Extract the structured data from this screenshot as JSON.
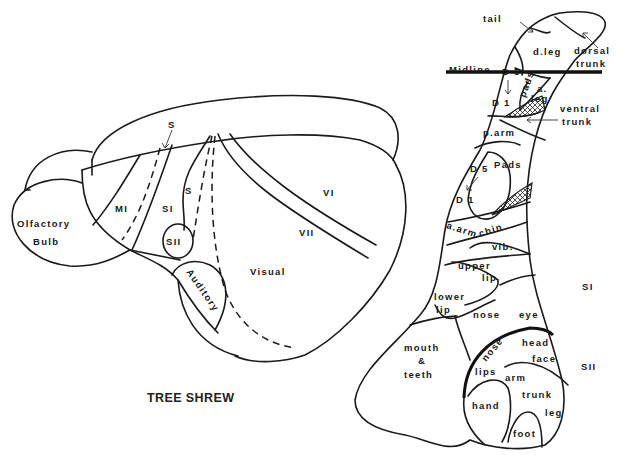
{
  "title": "TREE SHREW",
  "brain": {
    "regions": {
      "olfactory_line1": "Olfactory",
      "olfactory_line2": "Bulb",
      "mi": "MI",
      "si": "SI",
      "sii": "SII",
      "s_top": "S",
      "s_mid": "S",
      "auditory": "Auditory",
      "visual": "Visual",
      "vi": "VI",
      "vii": "VII"
    }
  },
  "somatotopic_map": {
    "midline": "Midline",
    "tail": "tail",
    "d_leg": "d.leg",
    "dorsal_trunk_1": "dorsal",
    "dorsal_trunk_2": "trunk",
    "d5_upper": "D 5",
    "d1_upper": "D 1",
    "pads_upper": "pads",
    "a_leg_1": "a.",
    "a_leg_2": "leg",
    "ventral_trunk_1": "ventral",
    "ventral_trunk_2": "trunk",
    "p_arm": "p.arm",
    "d5_lower": "D 5",
    "d1_lower": "D 1",
    "pads_lower": "Pads",
    "a_arm": "a.arm",
    "chin": "chin",
    "vib": "vib.",
    "upper_lip_1": "upper",
    "upper_lip_2": "lip",
    "lower_lip_1": "lower",
    "lower_lip_2": "lip",
    "nose": "nose",
    "eye": "eye",
    "mouth_1": "mouth",
    "mouth_2": "&",
    "mouth_3": "teeth",
    "si_label": "SI",
    "sii_label": "SII",
    "sii_regions": {
      "nose": "nose",
      "head": "head",
      "face": "face",
      "lips": "lips",
      "arm": "arm",
      "trunk": "trunk",
      "hand": "hand",
      "leg": "leg",
      "foot": "foot"
    }
  }
}
